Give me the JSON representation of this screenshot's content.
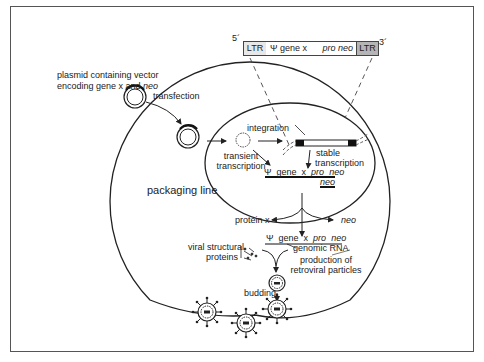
{
  "figure": {
    "vector_construct": {
      "five_prime": "5´",
      "three_prime": "3´",
      "ltr_left": "LTR",
      "psi_gene": "Ψ gene x",
      "pro_neo": "pro neo",
      "ltr_right": "LTR",
      "colors": {
        "ltr_left": "#e8e8e8",
        "body": "#ffffff",
        "ltr_right": "#b5b5b5"
      }
    },
    "labels": {
      "plasmid_line1": "plasmid containing vector",
      "plasmid_line2_prefix": "encoding gene x and ",
      "plasmid_line2_italic": "neo",
      "transfection": "transfection",
      "integration": "integration",
      "transient_line1": "transient",
      "transient_line2": "transcription",
      "stable_line1": "stable",
      "stable_line2": "transcription",
      "packaging_line": "packaging line",
      "mrna_psi": "Ψ",
      "mrna_gene": "gene",
      "mrna_x": "x",
      "mrna_pro": "pro",
      "mrna_neo": "neo",
      "neo_transcript": "neo",
      "protein_x": "protein x",
      "neo_product": "neo",
      "genomic_psi": "Ψ",
      "genomic_gene": "gene",
      "genomic_x": "x",
      "genomic_pro": "pro",
      "genomic_neo": "neo",
      "viral_line1": "viral structural",
      "viral_line2": "proteins",
      "genomic_rna": "genomic RNA",
      "production_line1": "production of",
      "production_line2": "retroviral particles",
      "budding": "budding"
    }
  }
}
